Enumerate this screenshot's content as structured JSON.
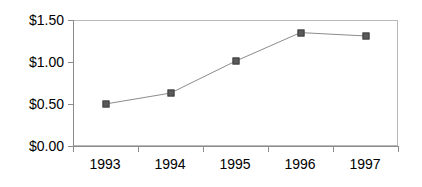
{
  "chart_data": {
    "type": "line",
    "title": "",
    "subtitle": "",
    "xlabel": "",
    "ylabel": "",
    "categories": [
      "1993",
      "1994",
      "1995",
      "1996",
      "1997"
    ],
    "values": [
      0.5,
      0.63,
      1.01,
      1.35,
      1.31
    ],
    "series": [
      {
        "name": "",
        "values": [
          0.5,
          0.63,
          1.01,
          1.35,
          1.31
        ]
      }
    ],
    "ylim": [
      0.0,
      1.5
    ],
    "ytick_values": [
      0.0,
      0.5,
      1.0,
      1.5
    ],
    "ytick_labels": [
      "$0.00",
      "$0.50",
      "$1.00",
      "$1.50"
    ],
    "xtick_labels": [
      "1993",
      "1994",
      "1995",
      "1996",
      "1997"
    ],
    "grid": false,
    "legend": false,
    "legend_position": "none",
    "marker": "square",
    "colors": {
      "marker_fill": "#5a5a5a",
      "marker_edge": "#404040",
      "line": "#8c8c8c",
      "axis": "#8c8c8c",
      "frame": "#b9b9b9",
      "text": "#000000",
      "background": "#ffffff"
    },
    "annotations": []
  }
}
